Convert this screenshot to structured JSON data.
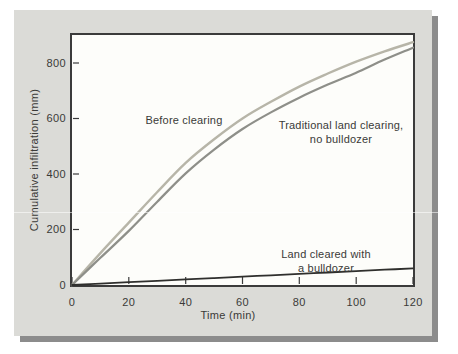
{
  "figure": {
    "page_bg": "#ffffff",
    "panel_bg": "#dbdbd7",
    "panel_shadow": "#8c8c8c",
    "plot_bg": "#fdfdfa",
    "frame_color": "#3b3b3b",
    "tick_color": "#3b3b3b",
    "text_color": "#3a3a38"
  },
  "chart_data": {
    "type": "line",
    "title": "",
    "xlabel": "Time (min)",
    "ylabel": "Cumulative infiltration (mm)",
    "xlim": [
      0,
      120
    ],
    "ylim": [
      0,
      908
    ],
    "x_ticks": [
      0,
      20,
      40,
      60,
      80,
      100,
      120
    ],
    "y_ticks": [
      0,
      200,
      400,
      600,
      800
    ],
    "grid": false,
    "legend_position": "inline-annotations",
    "x": [
      0,
      10,
      20,
      30,
      40,
      50,
      60,
      70,
      80,
      90,
      100,
      110,
      120
    ],
    "series": [
      {
        "name": "Before clearing",
        "color": "#b7b5a8",
        "stroke_width": 2.4,
        "values": [
          0,
          115,
          225,
          335,
          440,
          525,
          600,
          660,
          715,
          762,
          805,
          842,
          875
        ]
      },
      {
        "name": "Traditional land clearing, no bulldozer",
        "color": "#8e8f89",
        "stroke_width": 2.2,
        "values": [
          0,
          98,
          195,
          300,
          402,
          488,
          562,
          622,
          675,
          722,
          765,
          812,
          855
        ]
      },
      {
        "name": "Land cleared with a bulldozer",
        "color": "#2f2f2d",
        "stroke_width": 1.8,
        "values": [
          0,
          5,
          10,
          15,
          20,
          25,
          30,
          35,
          40,
          45,
          50,
          55,
          60
        ]
      }
    ],
    "annotations": [
      {
        "series": "Before clearing",
        "lines": [
          "Before clearing"
        ]
      },
      {
        "series": "Traditional land clearing, no bulldozer",
        "lines": [
          "Traditional land clearing,",
          "no bulldozer"
        ]
      },
      {
        "series": "Land cleared with a bulldozer",
        "lines": [
          "Land cleared with",
          "a bulldozer"
        ]
      }
    ]
  }
}
